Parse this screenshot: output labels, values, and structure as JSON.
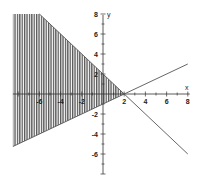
{
  "chart_data": {
    "type": "area",
    "title": "",
    "xlabel": "x",
    "ylabel": "y",
    "xlim": [
      -8.5,
      8
    ],
    "ylim": [
      -8,
      8
    ],
    "grid": false,
    "legend": null,
    "x_ticks": [
      -6,
      -4,
      -2,
      2,
      4,
      6,
      8
    ],
    "x_tick_labels": [
      "-6",
      "-4",
      "-2",
      "2",
      "4",
      "6",
      "8"
    ],
    "y_ticks": [
      8,
      6,
      4,
      2,
      -2,
      -4,
      -6
    ],
    "y_tick_labels": [
      "8",
      "6",
      "4",
      "2",
      "-2",
      "-4",
      "-6"
    ],
    "series": [
      {
        "name": "line 1",
        "equation": "y = -x + 2",
        "x": [
          -6,
          8
        ],
        "y": [
          8,
          -6
        ]
      },
      {
        "name": "line 2",
        "equation": "y = x/2 - 1",
        "x": [
          -8.5,
          8
        ],
        "y": [
          -5.25,
          3
        ]
      }
    ],
    "shaded_region": {
      "description": "Vertically hatched region left of intersection, between y = x/2 - 1 (below) and y = -x + 2 (above)",
      "vertices": [
        [
          -8.5,
          8
        ],
        [
          -6,
          8
        ],
        [
          2,
          0
        ],
        [
          -8.5,
          -5.25
        ]
      ],
      "fill": "vertical hatch lines"
    },
    "intersection": [
      2,
      0
    ]
  },
  "colors": {
    "line": "#555555",
    "hatch": "#444444",
    "axis": "#333333",
    "background": "#ffffff"
  }
}
